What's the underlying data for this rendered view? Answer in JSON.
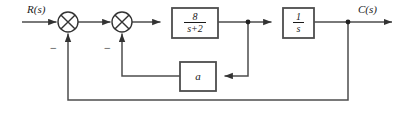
{
  "diagram": {
    "type": "control-system-block-diagram",
    "line_color": "#4d4d4d",
    "text_color": "#1a1a1a",
    "signals": {
      "input_label": "R(s)",
      "output_label": "C(s)"
    },
    "summing_junctions": [
      {
        "id": "outer-sum",
        "name": "summing-junction-outer",
        "cx": 68,
        "cy": 22,
        "r": 10,
        "feedback_sign": "−"
      },
      {
        "id": "inner-sum",
        "name": "summing-junction-inner",
        "cx": 122,
        "cy": 22,
        "r": 10,
        "feedback_sign": "−"
      }
    ],
    "blocks": [
      {
        "id": "plant-block",
        "name": "plant-transfer-function-block",
        "numerator": "8",
        "denominator": "s+2",
        "transfer_function": "8/(s+2)",
        "x": 172,
        "y": 8,
        "w": 46,
        "h": 30
      },
      {
        "id": "integrator-block",
        "name": "integrator-transfer-function-block",
        "numerator": "1",
        "denominator": "s",
        "transfer_function": "1/s",
        "x": 283,
        "y": 8,
        "w": 31,
        "h": 30
      },
      {
        "id": "gain-block",
        "name": "inner-feedback-gain-block",
        "label": "a",
        "transfer_function": "a",
        "x": 180,
        "y": 62,
        "w": 36,
        "h": 29
      }
    ],
    "paths": {
      "inner_feedback_tap_x": 248,
      "inner_feedback_y": 76,
      "outer_feedback_tap_x": 348,
      "outer_feedback_y": 100,
      "main_line_y": 22
    }
  }
}
